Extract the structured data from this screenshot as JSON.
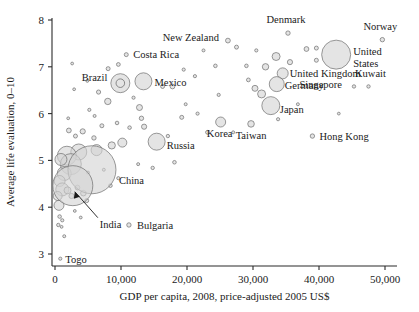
{
  "chart_data": {
    "type": "scatter",
    "title": "",
    "subtitle": "",
    "xlabel": "GDP per capita, 2008, price-adjusted 2005 US$",
    "ylabel": "Average life evaluation, 0–10",
    "xlim": [
      0,
      52000
    ],
    "ylim": [
      2.75,
      8.1
    ],
    "xticks": [
      0,
      10000,
      20000,
      30000,
      40000,
      50000
    ],
    "xticklabels": [
      "0",
      "10,000",
      "20,000",
      "30,000",
      "40,000",
      "50,000"
    ],
    "yticks": [
      3,
      4,
      5,
      6,
      7,
      8
    ],
    "yticklabels": [
      "3",
      "4",
      "5",
      "6",
      "7",
      "8"
    ],
    "grid": false,
    "legend": false,
    "size_encodes": "population",
    "marker_fill": "#d4d4d4",
    "marker_stroke": "#6e6e6e",
    "axis_color": "#2b2b2b",
    "labeled_points": [
      {
        "name": "Costa Rica",
        "x": 10800,
        "y": 7.26,
        "r": 2.0,
        "label_dx": 7,
        "label_dy": 3.5,
        "anchor": "start"
      },
      {
        "name": "Brazil",
        "x": 9900,
        "y": 6.65,
        "r": 9.5,
        "label_dx": -13,
        "label_dy": -2,
        "anchor": "end",
        "ring": true
      },
      {
        "name": "Mexico",
        "x": 13400,
        "y": 6.69,
        "r": 8.5,
        "label_dx": 11,
        "label_dy": 5,
        "anchor": "start"
      },
      {
        "name": "New Zealand",
        "x": 26200,
        "y": 7.56,
        "r": 2.4,
        "label_dx": -9,
        "label_dy": 0,
        "anchor": "end"
      },
      {
        "name": "Denmark",
        "x": 35300,
        "y": 7.72,
        "r": 2.2,
        "label_dx": -2,
        "label_dy": -10,
        "anchor": "middle"
      },
      {
        "name": "Norway",
        "x": 49600,
        "y": 7.58,
        "r": 2.2,
        "label_dx": -2,
        "label_dy": -10,
        "anchor": "middle"
      },
      {
        "name": "United States",
        "x": 42600,
        "y": 7.26,
        "r": 14.5,
        "label_dx": 17,
        "label_dy": 0,
        "anchor": "start",
        "two_line": true
      },
      {
        "name": "United Kingdom",
        "x": 34500,
        "y": 6.86,
        "r": 5.5,
        "label_dx": 7,
        "label_dy": 4,
        "anchor": "start"
      },
      {
        "name": "Germany",
        "x": 33600,
        "y": 6.63,
        "r": 7.5,
        "label_dx": 8,
        "label_dy": 5,
        "anchor": "start"
      },
      {
        "name": "Kuwait",
        "x": 47500,
        "y": 6.58,
        "r": 1.7,
        "label_dx": 2,
        "label_dy": -9,
        "anchor": "middle"
      },
      {
        "name": "Singapore",
        "x": 45300,
        "y": 6.58,
        "r": 1.7,
        "label_dx": -12,
        "label_dy": 2,
        "anchor": "end"
      },
      {
        "name": "Japan",
        "x": 32700,
        "y": 6.17,
        "r": 9.0,
        "label_dx": 9,
        "label_dy": 7,
        "anchor": "start"
      },
      {
        "name": "Russia",
        "x": 15400,
        "y": 5.4,
        "r": 8.5,
        "label_dx": 10,
        "label_dy": 7,
        "anchor": "start"
      },
      {
        "name": "Korea",
        "x": 25100,
        "y": 5.82,
        "r": 5.0,
        "label_dx": -1,
        "label_dy": 15,
        "anchor": "middle"
      },
      {
        "name": "Taiwan",
        "x": 29700,
        "y": 5.78,
        "r": 3.3,
        "label_dx": 0,
        "label_dy": 15,
        "anchor": "middle"
      },
      {
        "name": "Hong Kong",
        "x": 39000,
        "y": 5.52,
        "r": 2.2,
        "label_dx": 7,
        "label_dy": 4,
        "anchor": "start"
      },
      {
        "name": "China",
        "x": 5600,
        "y": 4.8,
        "r": 24.0,
        "label_dx": 27,
        "label_dy": 14,
        "anchor": "start"
      },
      {
        "name": "India",
        "x": 2700,
        "y": 4.46,
        "r": 20.0,
        "label_dx": 27,
        "label_dy": 42,
        "anchor": "start",
        "leader": true
      },
      {
        "name": "Bulgaria",
        "x": 11200,
        "y": 3.62,
        "r": 2.2,
        "label_dx": 8,
        "label_dy": 4,
        "anchor": "start"
      },
      {
        "name": "Togo",
        "x": 800,
        "y": 2.9,
        "r": 1.6,
        "label_dx": 5,
        "label_dy": 4,
        "anchor": "start"
      }
    ],
    "unlabeled_points": [
      {
        "x": 2600,
        "y": 7.07,
        "r": 1.4
      },
      {
        "x": 9600,
        "y": 7.05,
        "r": 1.9
      },
      {
        "x": 8050,
        "y": 6.96,
        "r": 2.0
      },
      {
        "x": 19500,
        "y": 6.94,
        "r": 1.6
      },
      {
        "x": 22500,
        "y": 7.35,
        "r": 1.5
      },
      {
        "x": 27500,
        "y": 7.42,
        "r": 2.0
      },
      {
        "x": 30500,
        "y": 7.35,
        "r": 1.6
      },
      {
        "x": 33500,
        "y": 7.22,
        "r": 4.0
      },
      {
        "x": 35600,
        "y": 7.1,
        "r": 2.6
      },
      {
        "x": 38100,
        "y": 7.38,
        "r": 2.4
      },
      {
        "x": 39600,
        "y": 7.4,
        "r": 2.0
      },
      {
        "x": 31900,
        "y": 7.0,
        "r": 3.2
      },
      {
        "x": 29000,
        "y": 7.02,
        "r": 1.8
      },
      {
        "x": 39600,
        "y": 7.14,
        "r": 2.0
      },
      {
        "x": 24300,
        "y": 7.02,
        "r": 1.8
      },
      {
        "x": 21200,
        "y": 6.8,
        "r": 1.6
      },
      {
        "x": 29300,
        "y": 6.72,
        "r": 1.9
      },
      {
        "x": 6600,
        "y": 6.46,
        "r": 2.1
      },
      {
        "x": 8000,
        "y": 6.26,
        "r": 3.2
      },
      {
        "x": 17800,
        "y": 6.58,
        "r": 2.4
      },
      {
        "x": 30300,
        "y": 6.54,
        "r": 3.0
      },
      {
        "x": 31300,
        "y": 6.42,
        "r": 4.0
      },
      {
        "x": 5200,
        "y": 6.08,
        "r": 1.6
      },
      {
        "x": 12800,
        "y": 6.13,
        "r": 3.0
      },
      {
        "x": 13100,
        "y": 5.9,
        "r": 2.2
      },
      {
        "x": 13500,
        "y": 5.72,
        "r": 2.6
      },
      {
        "x": 9400,
        "y": 5.8,
        "r": 1.8
      },
      {
        "x": 7100,
        "y": 5.74,
        "r": 2.0
      },
      {
        "x": 11300,
        "y": 5.7,
        "r": 1.8
      },
      {
        "x": 19200,
        "y": 5.92,
        "r": 2.0
      },
      {
        "x": 21600,
        "y": 6.0,
        "r": 1.6
      },
      {
        "x": 23100,
        "y": 5.6,
        "r": 1.9
      },
      {
        "x": 17100,
        "y": 5.52,
        "r": 1.7
      },
      {
        "x": 27000,
        "y": 5.6,
        "r": 1.5
      },
      {
        "x": 33800,
        "y": 5.88,
        "r": 1.6
      },
      {
        "x": 4200,
        "y": 5.62,
        "r": 2.6
      },
      {
        "x": 5900,
        "y": 5.48,
        "r": 2.2
      },
      {
        "x": 3100,
        "y": 5.52,
        "r": 2.0
      },
      {
        "x": 2100,
        "y": 5.64,
        "r": 2.4
      },
      {
        "x": 10200,
        "y": 5.38,
        "r": 4.5
      },
      {
        "x": 8600,
        "y": 5.32,
        "r": 3.6
      },
      {
        "x": 6300,
        "y": 5.22,
        "r": 5.5
      },
      {
        "x": 3600,
        "y": 5.18,
        "r": 8.0
      },
      {
        "x": 1800,
        "y": 5.1,
        "r": 9.5
      },
      {
        "x": 2400,
        "y": 4.92,
        "r": 10.5
      },
      {
        "x": 900,
        "y": 5.02,
        "r": 6.0
      },
      {
        "x": 1400,
        "y": 4.72,
        "r": 7.0
      },
      {
        "x": 700,
        "y": 4.56,
        "r": 5.5
      },
      {
        "x": 1100,
        "y": 4.38,
        "r": 6.5
      },
      {
        "x": 400,
        "y": 4.24,
        "r": 4.5
      },
      {
        "x": 600,
        "y": 4.04,
        "r": 5.0
      },
      {
        "x": 1900,
        "y": 4.36,
        "r": 3.5
      },
      {
        "x": 2500,
        "y": 4.24,
        "r": 2.6
      },
      {
        "x": 3400,
        "y": 4.42,
        "r": 2.4
      },
      {
        "x": 4300,
        "y": 4.3,
        "r": 2.8
      },
      {
        "x": 4800,
        "y": 4.14,
        "r": 2.0
      },
      {
        "x": 700,
        "y": 3.8,
        "r": 1.8
      },
      {
        "x": 1100,
        "y": 3.72,
        "r": 1.6
      },
      {
        "x": 500,
        "y": 3.62,
        "r": 1.7
      },
      {
        "x": 1000,
        "y": 3.58,
        "r": 1.4
      },
      {
        "x": 1400,
        "y": 3.38,
        "r": 1.5
      },
      {
        "x": 3000,
        "y": 3.92,
        "r": 1.4
      },
      {
        "x": 3900,
        "y": 3.78,
        "r": 1.4
      },
      {
        "x": 8400,
        "y": 4.46,
        "r": 1.8
      },
      {
        "x": 9600,
        "y": 4.62,
        "r": 1.6
      },
      {
        "x": 12600,
        "y": 4.92,
        "r": 1.5
      },
      {
        "x": 14800,
        "y": 4.84,
        "r": 1.7
      },
      {
        "x": 18100,
        "y": 4.96,
        "r": 1.8
      },
      {
        "x": 5000,
        "y": 4.74,
        "r": 1.5
      },
      {
        "x": 7400,
        "y": 4.8,
        "r": 1.5
      },
      {
        "x": 2900,
        "y": 6.52,
        "r": 1.4
      },
      {
        "x": 4900,
        "y": 6.7,
        "r": 1.5
      },
      {
        "x": 11900,
        "y": 6.34,
        "r": 1.6
      },
      {
        "x": 16300,
        "y": 6.58,
        "r": 2.0
      },
      {
        "x": 19800,
        "y": 6.2,
        "r": 1.5
      },
      {
        "x": 24800,
        "y": 6.4,
        "r": 1.6
      },
      {
        "x": 36800,
        "y": 6.2,
        "r": 1.5
      },
      {
        "x": 43000,
        "y": 6.0,
        "r": 1.4
      },
      {
        "x": 6000,
        "y": 5.95,
        "r": 1.5
      },
      {
        "x": 2000,
        "y": 5.9,
        "r": 1.4
      }
    ]
  },
  "geometry": {
    "plot_left": 52,
    "plot_right": 397,
    "plot_top": 18,
    "plot_bottom": 266,
    "x0_px": 55,
    "x50k_px": 385,
    "y8_px": 20,
    "y3_px": 254
  }
}
